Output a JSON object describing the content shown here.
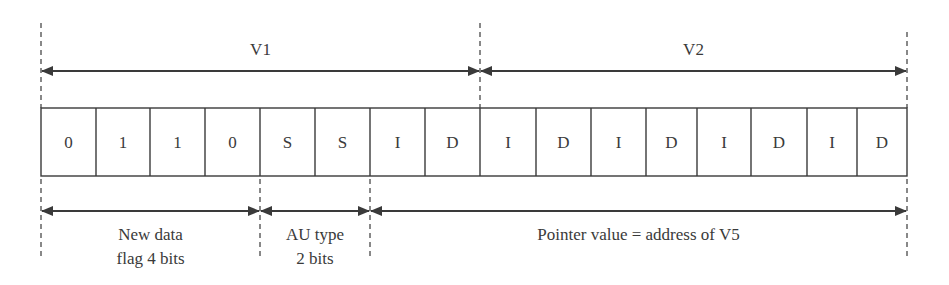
{
  "diagram": {
    "top_spans": [
      {
        "label": "V1",
        "x1": 41,
        "x2": 480
      },
      {
        "label": "V2",
        "x1": 480,
        "x2": 907
      }
    ],
    "cells": [
      "0",
      "1",
      "1",
      "0",
      "S",
      "S",
      "I",
      "D",
      "I",
      "D",
      "I",
      "D",
      "I",
      "D",
      "I",
      "D"
    ],
    "cell_edges": [
      41,
      96,
      150,
      205,
      260,
      315,
      370,
      425,
      480,
      536,
      591,
      646,
      697,
      751,
      807,
      857,
      907
    ],
    "bottom_spans": [
      {
        "label_line1": "New data",
        "label_line2": "flag 4 bits",
        "x1": 41,
        "x2": 260
      },
      {
        "label_line1": "AU type",
        "label_line2": "2 bits",
        "x1": 260,
        "x2": 370
      },
      {
        "label_line1": "Pointer value = address of V5",
        "label_line2": "",
        "x1": 370,
        "x2": 907
      }
    ],
    "colors": {
      "line": "#3a3a3a",
      "text": "#3a3a3a",
      "background": "#ffffff"
    }
  }
}
